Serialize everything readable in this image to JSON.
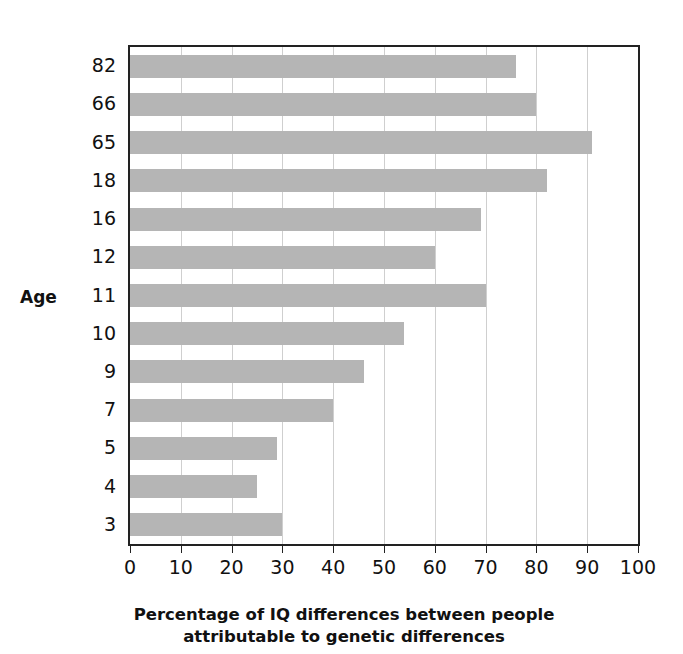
{
  "chart_data": {
    "type": "bar",
    "orientation": "horizontal",
    "title": "",
    "xlabel": "Percentage of IQ differences between people attributable to genetic differences",
    "xlabel_line1": "Percentage of IQ differences between people",
    "xlabel_line2": "attributable to genetic differences",
    "ylabel": "Age",
    "categories": [
      "3",
      "4",
      "5",
      "7",
      "9",
      "10",
      "11",
      "12",
      "16",
      "18",
      "65",
      "66",
      "82"
    ],
    "values": [
      30,
      25,
      29,
      40,
      46,
      54,
      70,
      60,
      69,
      82,
      91,
      80,
      76
    ],
    "display_order_top_to_bottom": [
      "82",
      "66",
      "65",
      "18",
      "16",
      "12",
      "11",
      "10",
      "9",
      "7",
      "5",
      "4",
      "3"
    ],
    "xlim": [
      0,
      100
    ],
    "xticks": [
      "0",
      "10",
      "20",
      "30",
      "40",
      "50",
      "60",
      "70",
      "80",
      "90",
      "100"
    ],
    "grid": "vertical",
    "legend": "none",
    "bar_color": "#b5b5b5",
    "axis_color": "#222222",
    "grid_color": "#cfcfcf",
    "background": "#ffffff"
  }
}
